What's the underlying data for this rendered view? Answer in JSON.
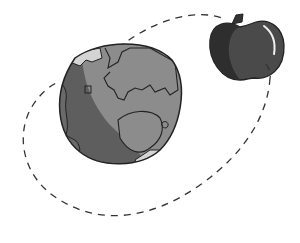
{
  "illustration": {
    "subject": "Earth with an apple orbiting it along a dashed path",
    "elements": [
      "earth-globe",
      "apple",
      "orbit-path"
    ]
  },
  "colors": {
    "background": "#ffffff",
    "earth_light": "#8c8c8c",
    "earth_dark": "#5e5e5e",
    "earth_ice": "#d4d4d4",
    "outline": "#222222",
    "apple_body": "#4a4a4a",
    "apple_shadow": "#2e2e2e",
    "apple_highlight": "#f0f0f0",
    "orbit": "#333333"
  }
}
